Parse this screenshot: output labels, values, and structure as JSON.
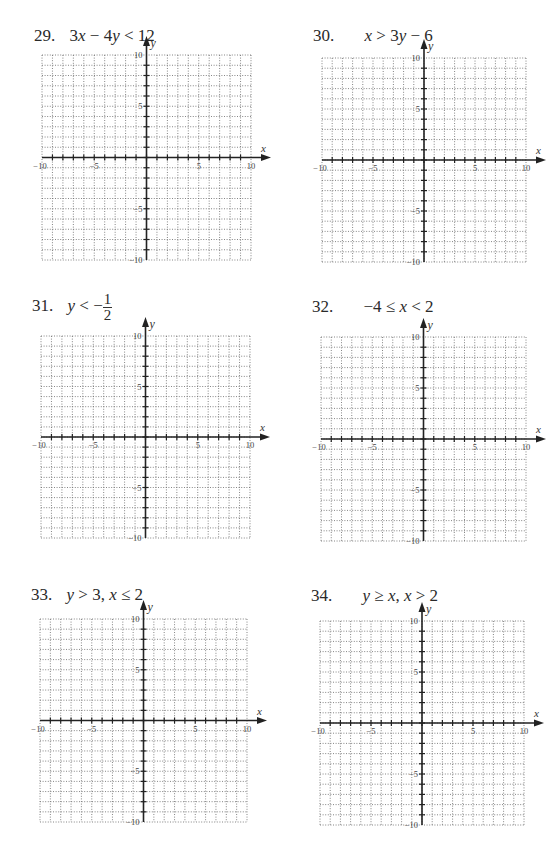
{
  "page": {
    "type": "worksheet",
    "topic": "Graphing linear inequalities"
  },
  "problems": [
    {
      "number": "29.",
      "parts": [
        {
          "t": "3"
        },
        {
          "i": "x"
        },
        {
          "t": " − 4"
        },
        {
          "i": "y"
        },
        {
          "t": " < 12"
        }
      ],
      "text": "3x − 4y < 12"
    },
    {
      "number": "30.",
      "parts": [
        {
          "i": "x"
        },
        {
          "t": " > 3"
        },
        {
          "i": "y"
        },
        {
          "t": " − 6"
        }
      ],
      "text": "x > 3y − 6"
    },
    {
      "number": "31.",
      "parts": [
        {
          "i": "y"
        },
        {
          "t": " < −"
        },
        {
          "frac": [
            "1",
            "2"
          ]
        }
      ],
      "text": "y < −1/2"
    },
    {
      "number": "32.",
      "parts": [
        {
          "t": "−4 ≤ "
        },
        {
          "i": "x"
        },
        {
          "t": " < 2"
        }
      ],
      "text": "−4 ≤ x < 2"
    },
    {
      "number": "33.",
      "parts": [
        {
          "i": "y"
        },
        {
          "t": " > 3,  "
        },
        {
          "i": "x"
        },
        {
          "t": " ≤ 2"
        }
      ],
      "text": "y > 3, x ≤ 2"
    },
    {
      "number": "34.",
      "parts": [
        {
          "i": "y"
        },
        {
          "t": " ≥ "
        },
        {
          "i": "x"
        },
        {
          "t": ",  "
        },
        {
          "i": "x"
        },
        {
          "t": " > 2"
        }
      ],
      "text": "y ≥ x, x > 2"
    }
  ],
  "chart_data": [
    {
      "type": "scatter",
      "title": "29. 3x − 4y < 12",
      "xlabel": "x",
      "ylabel": "y",
      "xlim": [
        -10,
        10
      ],
      "ylim": [
        -10,
        10
      ],
      "grid": true,
      "grid_step": 1,
      "x_tick_labels": [
        "-10",
        "-5",
        "5",
        "10"
      ],
      "y_tick_labels": [
        "10",
        "5",
        "-5",
        "-10"
      ],
      "series": []
    },
    {
      "type": "scatter",
      "title": "30. x > 3y − 6",
      "xlabel": "x",
      "ylabel": "y",
      "xlim": [
        -10,
        10
      ],
      "ylim": [
        -10,
        10
      ],
      "grid": true,
      "grid_step": 1,
      "x_tick_labels": [
        "-10",
        "-5",
        "5",
        "10"
      ],
      "y_tick_labels": [
        "10",
        "5",
        "-5",
        "-10"
      ],
      "series": []
    },
    {
      "type": "scatter",
      "title": "31. y < −1/2",
      "xlabel": "x",
      "ylabel": "y",
      "xlim": [
        -10,
        10
      ],
      "ylim": [
        -10,
        10
      ],
      "grid": true,
      "grid_step": 1,
      "x_tick_labels": [
        "-10",
        "-5",
        "5",
        "10"
      ],
      "y_tick_labels": [
        "10",
        "5",
        "-5",
        "-10"
      ],
      "series": []
    },
    {
      "type": "scatter",
      "title": "32. −4 ≤ x < 2",
      "xlabel": "x",
      "ylabel": "y",
      "xlim": [
        -10,
        10
      ],
      "ylim": [
        -10,
        10
      ],
      "grid": true,
      "grid_step": 1,
      "x_tick_labels": [
        "-10",
        "-5",
        "5",
        "10"
      ],
      "y_tick_labels": [
        "10",
        "5",
        "-5",
        "-10"
      ],
      "series": []
    },
    {
      "type": "scatter",
      "title": "33. y > 3, x ≤ 2",
      "xlabel": "x",
      "ylabel": "y",
      "xlim": [
        -10,
        10
      ],
      "ylim": [
        -10,
        10
      ],
      "grid": true,
      "grid_step": 1,
      "x_tick_labels": [
        "-10",
        "-5",
        "5",
        "10"
      ],
      "y_tick_labels": [
        "10",
        "5",
        "-5",
        "-10"
      ],
      "series": []
    },
    {
      "type": "scatter",
      "title": "34. y ≥ x, x > 2",
      "xlabel": "x",
      "ylabel": "y",
      "xlim": [
        -10,
        10
      ],
      "ylim": [
        -10,
        10
      ],
      "grid": true,
      "grid_step": 1,
      "x_tick_labels": [
        "-10",
        "-5",
        "5",
        "10"
      ],
      "y_tick_labels": [
        "10",
        "5",
        "-5",
        "-10"
      ],
      "series": []
    }
  ]
}
